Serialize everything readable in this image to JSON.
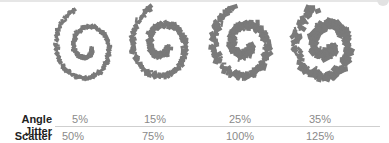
{
  "figure": {
    "spiral_color": "#7a7a7a",
    "spirals": [
      {
        "cx": 87,
        "cy": 47,
        "jitter": 1.5
      },
      {
        "cx": 163,
        "cy": 45,
        "jitter": 2.5
      },
      {
        "cx": 245,
        "cy": 45,
        "jitter": 3.5
      },
      {
        "cx": 327,
        "cy": 45,
        "jitter": 4.5
      }
    ]
  },
  "table": {
    "rows": [
      {
        "label": "Angle Jitter",
        "values": [
          "5%",
          "15%",
          "25%",
          "35%"
        ]
      },
      {
        "label": "Scatter",
        "values": [
          "50%",
          "75%",
          "100%",
          "125%"
        ]
      }
    ]
  }
}
